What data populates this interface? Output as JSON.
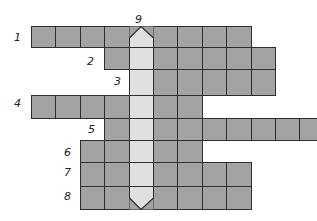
{
  "puzzle": {
    "type": "crossword-ladder",
    "colors": {
      "cell": "#a3a3a3",
      "highlight_column": "#e0e0e0",
      "border": "#2e2e2e",
      "background": "#ffffff"
    },
    "origin_x": 31,
    "cell_width": 24.4,
    "highlight_col": 4,
    "rows": [
      {
        "clue": "1",
        "top": 26,
        "height": 21,
        "start_col": 0,
        "end_col": 8,
        "label_x": 14,
        "label_y": 32
      },
      {
        "clue": "2",
        "top": 47,
        "height": 22,
        "start_col": 3,
        "end_col": 9,
        "label_x": 87,
        "label_y": 56
      },
      {
        "clue": "3",
        "top": 69,
        "height": 26,
        "start_col": 4,
        "end_col": 9,
        "label_x": 114,
        "label_y": 76
      },
      {
        "clue": "4",
        "top": 95,
        "height": 23,
        "start_col": 0,
        "end_col": 6,
        "label_x": 14,
        "label_y": 98
      },
      {
        "clue": "5",
        "top": 118,
        "height": 22,
        "start_col": 3,
        "end_col": 11,
        "label_x": 88,
        "label_y": 124
      },
      {
        "clue": "6",
        "top": 140,
        "height": 22,
        "start_col": 2,
        "end_col": 6,
        "label_x": 64,
        "label_y": 147
      },
      {
        "clue": "7",
        "top": 162,
        "height": 24,
        "start_col": 2,
        "end_col": 8,
        "label_x": 64,
        "label_y": 167
      },
      {
        "clue": "8",
        "top": 186,
        "height": 23,
        "start_col": 2,
        "end_col": 8,
        "label_x": 64,
        "label_y": 191
      }
    ],
    "vertical_clue": {
      "clue": "9",
      "label_x": 135,
      "label_y": 14
    }
  }
}
